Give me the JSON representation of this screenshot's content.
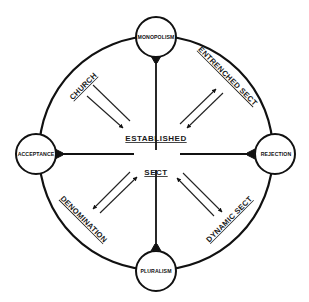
{
  "diagram": {
    "nodes": {
      "top": "MONOPOLISM",
      "right": "REJECTION",
      "bottom": "PLURALISM",
      "left": "ACCEPTANCE"
    },
    "types": {
      "top_left": "CHURCH",
      "top_right": "ENTRENCHED SECT",
      "bottom_left": "DENOMINATION",
      "bottom_right": "DYNAMIC SECT"
    },
    "center": {
      "upper": "ESTABLISHED",
      "lower": "SECT"
    },
    "colors": {
      "ink": "#111111",
      "background": "#ffffff"
    }
  }
}
